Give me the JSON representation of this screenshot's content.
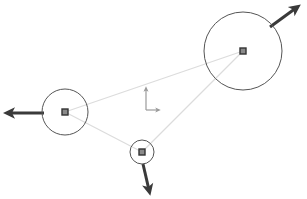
{
  "figure": {
    "kind": "rigid-body-diagram",
    "background_color": "#ffffff",
    "width": 307,
    "height": 199
  },
  "style": {
    "circle_stroke": "#555555",
    "circle_fill": "none",
    "circle_stroke_width": 1,
    "link_stroke": "#dcdcdc",
    "link_stroke_width": 1.2,
    "marker_stroke": "#333333",
    "marker_fill": "#8a8a8a",
    "marker_size": 6,
    "arrow_stroke": "#3a3a3a",
    "arrow_stroke_width": 3,
    "axes_stroke": "#9a9a9a",
    "axes_stroke_width": 1.2
  },
  "bodies": [
    {
      "id": "body-large",
      "name": "large-circle-body",
      "cx": 243,
      "cy": 51,
      "r": 39,
      "marker": {
        "cx": 243,
        "cy": 51
      },
      "arrow": {
        "x1": 270,
        "y1": 27,
        "x2": 296,
        "y2": 8,
        "direction": "up-right"
      }
    },
    {
      "id": "body-medium",
      "name": "medium-circle-body",
      "cx": 65,
      "cy": 112,
      "r": 23,
      "marker": {
        "cx": 65,
        "cy": 112
      },
      "arrow": {
        "x1": 44,
        "y1": 113,
        "x2": 9,
        "y2": 113,
        "direction": "left"
      }
    },
    {
      "id": "body-small",
      "name": "small-circle-body",
      "cx": 142,
      "cy": 152,
      "r": 12,
      "marker": {
        "cx": 142,
        "cy": 152
      },
      "arrow": {
        "x1": 143,
        "y1": 164,
        "x2": 149,
        "y2": 190,
        "direction": "down"
      }
    }
  ],
  "links": [
    {
      "id": "link-medium-large",
      "name": "link-medium-to-large",
      "x1": 65,
      "y1": 112,
      "x2": 243,
      "y2": 51
    },
    {
      "id": "link-medium-small",
      "name": "link-medium-to-small",
      "x1": 65,
      "y1": 112,
      "x2": 142,
      "y2": 152
    },
    {
      "id": "link-small-large",
      "name": "link-small-to-large",
      "x1": 142,
      "y1": 152,
      "x2": 243,
      "y2": 51
    }
  ],
  "axes": {
    "name": "coordinate-axes-indicator",
    "origin_x": 146,
    "origin_y": 110,
    "y_tip_x": 146,
    "y_tip_y": 89,
    "x_tip_x": 158,
    "x_tip_y": 110
  }
}
